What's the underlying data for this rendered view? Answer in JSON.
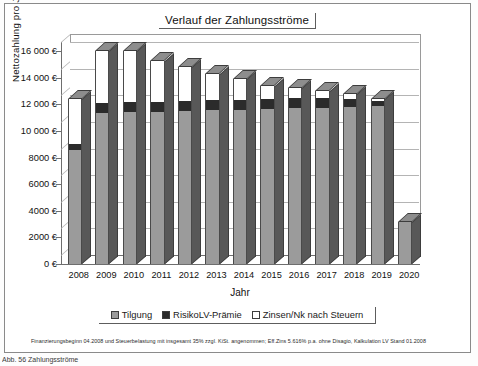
{
  "chart_data": {
    "type": "bar",
    "title": "Verlauf der Zahlungsströme",
    "xlabel": "Jahr",
    "ylabel": "Nettozahlung pro Jahr",
    "ylim": [
      0,
      16000
    ],
    "ytick_values": [
      0,
      2000,
      4000,
      6000,
      8000,
      10000,
      12000,
      14000,
      16000
    ],
    "ytick_labels": [
      "0 €",
      "2000 €",
      "4000 €",
      "6000 €",
      "8000 €",
      "10 000 €",
      "12 000 €",
      "14 000 €",
      "16 000 €"
    ],
    "grid": true,
    "stacked": true,
    "legend_position": "bottom",
    "categories": [
      "2008",
      "2009",
      "2010",
      "2011",
      "2012",
      "2013",
      "2014",
      "2015",
      "2016",
      "2017",
      "2018",
      "2019",
      "2020"
    ],
    "series": [
      {
        "name": "Tilgung",
        "color": "#9b9b9b",
        "values": [
          8600,
          11350,
          11400,
          11450,
          11500,
          11550,
          11600,
          11650,
          11700,
          11750,
          11800,
          11850,
          3150
        ]
      },
      {
        "name": "RisikoLV-Prämie",
        "color": "#2b2b2b",
        "values": [
          400,
          750,
          750,
          750,
          750,
          750,
          750,
          750,
          750,
          700,
          600,
          400,
          0
        ]
      },
      {
        "name": "Zinsen/Nk nach Steuern",
        "color": "#ffffff",
        "values": [
          3400,
          3900,
          3850,
          3050,
          2550,
          2000,
          1550,
          1000,
          750,
          550,
          350,
          150,
          0
        ]
      }
    ],
    "totals": [
      12400,
      16000,
      16000,
      15250,
      14800,
      14300,
      13900,
      13400,
      13200,
      13000,
      12750,
      12400,
      3150
    ],
    "footnote": "Finanzierungsbeginn 04.2008 und Steuerbelastung mit insgesamt 35% zzgl. KiSt. angenommen; Eff.Zins 5.616% p.a. ohne Disagio, Kalkulation LV Stand 01.2008"
  },
  "legend": {
    "items": [
      {
        "label": "Tilgung"
      },
      {
        "label": "RisikoLV-Prämie"
      },
      {
        "label": "Zinsen/Nk nach Steuern"
      }
    ]
  },
  "caption": "Abb. 56 Zahlungsströme"
}
